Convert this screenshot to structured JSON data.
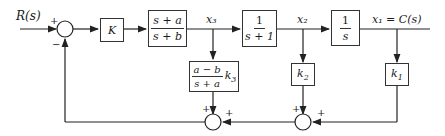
{
  "diagram": {
    "type": "block-diagram",
    "input": {
      "label": "R(s)"
    },
    "output": {
      "label": "x₁ = C(s)"
    },
    "signals": {
      "x3": "x₃",
      "x2": "x₂"
    },
    "summing_junctions": [
      {
        "id": "sum-main",
        "signs": {
          "top": "+",
          "bottom": "−"
        }
      },
      {
        "id": "sum-inner-left",
        "signs": {
          "left": "+",
          "right": "+"
        }
      },
      {
        "id": "sum-inner-right",
        "signs": {
          "left": "+",
          "right": "+"
        }
      }
    ],
    "blocks": {
      "gain_k": {
        "text": "K"
      },
      "lead": {
        "num": "s + a",
        "den": "s + b"
      },
      "plant1": {
        "num": "1",
        "den": "s + 1"
      },
      "integrator": {
        "num": "1",
        "den": "s"
      },
      "feedback_k3": {
        "num": "a − b",
        "den": "s + a",
        "gain": "k",
        "gain_sub": "3"
      },
      "feedback_k2": {
        "gain": "k",
        "gain_sub": "2"
      },
      "feedback_k1": {
        "gain": "k",
        "gain_sub": "1"
      }
    },
    "signs": {
      "plus": "+",
      "minus": "−"
    }
  }
}
